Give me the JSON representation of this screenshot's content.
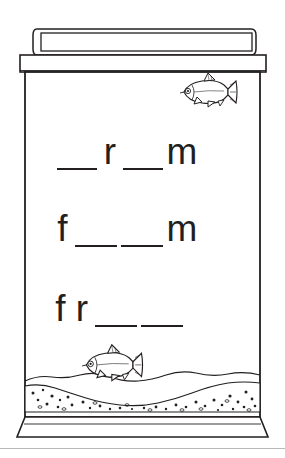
{
  "worksheet": {
    "title": "Fish tank word blanks worksheet",
    "ink_color": "#231f20",
    "paper_color": "#ffffff",
    "rule_color": "#b8b8b8"
  },
  "tank": {
    "lid_label": "aquarium-hood-lid",
    "rim_label": "aquarium-rim",
    "body_label": "aquarium-glass-body",
    "base_label": "aquarium-base",
    "waterline_label": "water-surface-wavy-line",
    "gravel_label": "gravel-substrate"
  },
  "fish": [
    {
      "name": "fish-top-right",
      "x": 178,
      "y": 77,
      "width": 58,
      "height": 30,
      "facing": "left"
    },
    {
      "name": "fish-bottom-left",
      "x": 80,
      "y": 349,
      "width": 62,
      "height": 31,
      "facing": "left"
    }
  ],
  "word_lines": [
    {
      "id": "word-line-1",
      "answer_pattern": "_r_m",
      "left": 55,
      "baseline": 170,
      "slots": [
        {
          "type": "blank",
          "text": " ",
          "width": 44
        },
        {
          "type": "letter",
          "text": "r",
          "width": 22
        },
        {
          "type": "blank",
          "text": " ",
          "width": 44
        },
        {
          "type": "letter",
          "text": "m",
          "width": 34
        }
      ]
    },
    {
      "id": "word-line-2",
      "answer_pattern": "f__m",
      "left": 52,
      "baseline": 247,
      "slots": [
        {
          "type": "letter",
          "text": "f",
          "width": 21
        },
        {
          "type": "blank",
          "text": " ",
          "width": 46
        },
        {
          "type": "blank",
          "text": " ",
          "width": 46
        },
        {
          "type": "letter",
          "text": "m",
          "width": 34
        }
      ]
    },
    {
      "id": "word-line-3",
      "answer_pattern": "fr__",
      "left": 50,
      "baseline": 327,
      "slots": [
        {
          "type": "letter",
          "text": "f",
          "width": 21
        },
        {
          "type": "letter",
          "text": "r",
          "width": 22
        },
        {
          "type": "blank",
          "text": " ",
          "width": 46
        },
        {
          "type": "blank",
          "text": " ",
          "width": 46
        }
      ]
    }
  ],
  "bottom_rule": {
    "name": "page-divider-rule",
    "y": 448
  }
}
